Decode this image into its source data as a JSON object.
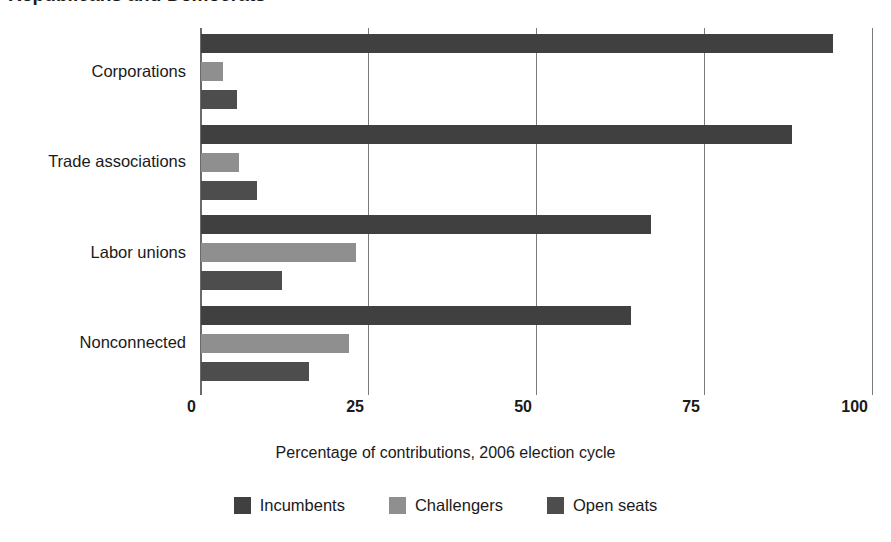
{
  "figure": {
    "title_partial": "Republicans and Democrats",
    "title_cropped": true
  },
  "chart_data": {
    "type": "bar",
    "orientation": "horizontal",
    "grouped": true,
    "title": "",
    "xlabel": "Percentage of contributions, 2006 election cycle",
    "ylabel": "",
    "xlim": [
      0,
      100
    ],
    "xticks": [
      "0",
      "25",
      "50",
      "75",
      "100"
    ],
    "xtick_values": [
      0,
      25,
      50,
      75,
      100
    ],
    "grid": "vertical",
    "legend_position": "bottom",
    "categories": [
      "Corporations",
      "Trade associations",
      "Labor unions",
      "Nonconnected"
    ],
    "series": [
      {
        "name": "Incumbents",
        "color": "#404040",
        "values": [
          94,
          88,
          67,
          64
        ]
      },
      {
        "name": "Challengers",
        "color": "#8f8f8f",
        "values": [
          3.3,
          5.7,
          23,
          22
        ]
      },
      {
        "name": "Open seats",
        "color": "#4d4d4d",
        "values": [
          5.4,
          8.3,
          12,
          16
        ]
      }
    ]
  },
  "axis": {
    "ticks": [
      {
        "label": "0",
        "value": 0
      },
      {
        "label": "25",
        "value": 25
      },
      {
        "label": "50",
        "value": 50
      },
      {
        "label": "75",
        "value": 75
      },
      {
        "label": "100",
        "value": 100
      }
    ],
    "title": "Percentage of contributions, 2006 election cycle"
  },
  "legend": {
    "items": [
      {
        "label": "Incumbents",
        "color": "#404040"
      },
      {
        "label": "Challengers",
        "color": "#8f8f8f"
      },
      {
        "label": "Open seats",
        "color": "#4d4d4d"
      }
    ]
  },
  "colors": {
    "incumbents": "#404040",
    "challengers": "#8f8f8f",
    "open_seats": "#4d4d4d",
    "gridline": "#7a7a7a",
    "text": "#1a1a1a",
    "background": "#ffffff"
  }
}
